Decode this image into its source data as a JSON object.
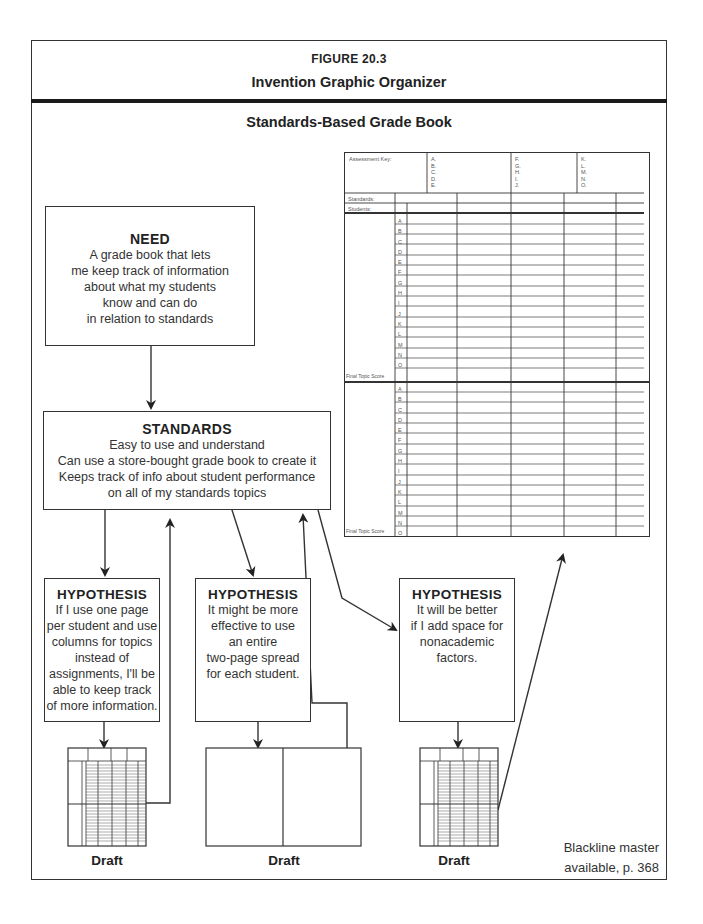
{
  "header": {
    "figure_label": "FIGURE 20.3",
    "figure_title": "Invention Graphic Organizer"
  },
  "subtitle": "Standards-Based Grade Book",
  "need": {
    "title": "NEED",
    "lines": [
      "A grade book that lets",
      "me keep track of information",
      "about what my students",
      "know and can do",
      "in relation to standards"
    ]
  },
  "standards": {
    "title": "STANDARDS",
    "lines": [
      "Easy to use and understand",
      "Can use a store-bought grade book to create it",
      "Keeps track of info about student performance",
      "on all of my standards topics"
    ]
  },
  "hypotheses": [
    {
      "title": "HYPOTHESIS",
      "lines": [
        "If I use one page",
        "per student and use",
        "columns for topics",
        "instead of",
        "assignments, I'll be",
        "able to keep track",
        "of more information."
      ]
    },
    {
      "title": "HYPOTHESIS",
      "lines": [
        "It might be more",
        "effective to use",
        "an entire",
        "two-page spread",
        "for each student."
      ]
    },
    {
      "title": "HYPOTHESIS",
      "lines": [
        "It will be better",
        "if I add space for",
        "nonacademic",
        "factors."
      ]
    }
  ],
  "drafts": [
    "Draft",
    "Draft",
    "Draft"
  ],
  "gradebook": {
    "assessment_key_label": "Assessment Key:",
    "key_groups": [
      [
        "A.",
        "B.",
        "C.",
        "D.",
        "E."
      ],
      [
        "F.",
        "G.",
        "H.",
        "I.",
        "J."
      ],
      [
        "K.",
        "L.",
        "M.",
        "N.",
        "O."
      ]
    ],
    "standards_label": "Standards:",
    "students_label": "Students:",
    "student_letters": [
      "A",
      "B",
      "C",
      "D",
      "E",
      "F",
      "G",
      "H",
      "I",
      "J",
      "K",
      "L",
      "M",
      "N",
      "O"
    ],
    "final_label": "Final Topic Score"
  },
  "footer": {
    "blackline_line1": "Blackline master",
    "blackline_line2": "available, p. 368"
  }
}
